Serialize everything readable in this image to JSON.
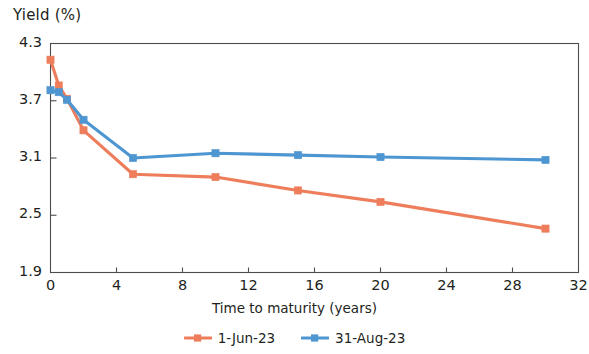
{
  "chart_data": {
    "type": "line",
    "title": "",
    "ylabel": "Yield (%)",
    "xlabel": "Time to maturity (years)",
    "xlim": [
      0,
      32
    ],
    "ylim": [
      1.9,
      4.3
    ],
    "xticks": [
      "0",
      "4",
      "8",
      "12",
      "16",
      "20",
      "24",
      "28",
      "32"
    ],
    "xtick_values": [
      0,
      4,
      8,
      12,
      16,
      20,
      24,
      28,
      32
    ],
    "yticks": [
      "1.9",
      "2.5",
      "3.1",
      "3.7",
      "4.3"
    ],
    "ytick_values": [
      1.9,
      2.5,
      3.1,
      3.7,
      4.3
    ],
    "grid": false,
    "legend_position": "bottom-center",
    "x": [
      0,
      0.5,
      1,
      2,
      5,
      10,
      15,
      20,
      30
    ],
    "series": [
      {
        "name": "1-Jun-23",
        "color": "#ED7D5B",
        "marker": "square",
        "values": [
          4.13,
          3.86,
          3.72,
          3.39,
          2.93,
          2.9,
          2.76,
          2.64,
          2.36
        ]
      },
      {
        "name": "31-Aug-23",
        "color": "#4E96D1",
        "marker": "square",
        "values": [
          3.81,
          3.79,
          3.71,
          3.5,
          3.1,
          3.15,
          3.13,
          3.11,
          3.08
        ]
      }
    ]
  },
  "legend": {
    "items": [
      {
        "label": "1-Jun-23",
        "color": "#ED7D5B"
      },
      {
        "label": "31-Aug-23",
        "color": "#4E96D1"
      }
    ]
  },
  "axes": {
    "frame_color": "#4d4d4d"
  }
}
